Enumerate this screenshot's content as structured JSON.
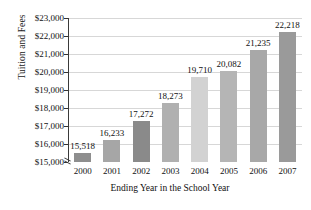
{
  "chart_data": {
    "type": "bar",
    "title": "",
    "xlabel": "Ending Year in the School Year",
    "ylabel": "Tuition and Fees",
    "categories": [
      "2000",
      "2001",
      "2002",
      "2003",
      "2004",
      "2005",
      "2006",
      "2007"
    ],
    "values": [
      15518,
      16233,
      17272,
      18273,
      19710,
      20082,
      21235,
      22218
    ],
    "value_labels": [
      "15,518",
      "16,233",
      "17,272",
      "18,273",
      "19,710",
      "20,082",
      "21,235",
      "22,218"
    ],
    "ylim": [
      15000,
      23000
    ],
    "y_axis_broken": true,
    "y_ticks": [
      15000,
      16000,
      17000,
      18000,
      19000,
      20000,
      21000,
      22000,
      23000
    ],
    "y_tick_labels": [
      "$15,000",
      "$16,000",
      "$17,000",
      "$18,000",
      "$19,000",
      "$20,000",
      "$21,000",
      "$22,000",
      "$23,000"
    ],
    "grid": true,
    "legend": "none",
    "bar_colors": [
      "#8e8e8e",
      "#a6a6a6",
      "#8a8a8a",
      "#b0b0b0",
      "#d2d2d2",
      "#b5b5b5",
      "#a8a8a8",
      "#9a9a9a"
    ],
    "colors": {
      "background": "#ffffff",
      "gridline": "#d7d7d7",
      "axis": "#3a3a3a",
      "text": "#111111"
    }
  }
}
